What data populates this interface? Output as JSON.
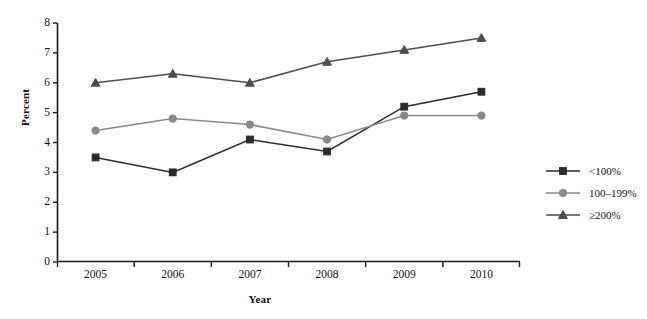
{
  "chart_data": {
    "type": "line",
    "title": "",
    "xlabel": "Year",
    "ylabel": "Percent",
    "categories": [
      "2005",
      "2006",
      "2007",
      "2008",
      "2009",
      "2010"
    ],
    "x": [
      2005,
      2006,
      2007,
      2008,
      2009,
      2010
    ],
    "ylim": [
      0,
      8
    ],
    "yticks": [
      0,
      1,
      2,
      3,
      4,
      5,
      6,
      7,
      8
    ],
    "ytick_labels": [
      "0",
      "1",
      "2",
      "3",
      "4",
      "5",
      "6",
      "7",
      "8"
    ],
    "grid": false,
    "legend_position": "right",
    "series": [
      {
        "name": "<100%",
        "values": [
          3.5,
          3.0,
          4.1,
          3.7,
          5.2,
          5.7
        ],
        "color": "#2b2b2b",
        "marker": "square"
      },
      {
        "name": "100–199%",
        "values": [
          4.4,
          4.8,
          4.6,
          4.1,
          4.9,
          4.9
        ],
        "color": "#8a8a8a",
        "marker": "circle"
      },
      {
        "name": "≥200%",
        "values": [
          6.0,
          6.3,
          6.0,
          6.7,
          7.1,
          7.5
        ],
        "color": "#4d4d4d",
        "marker": "triangle"
      }
    ]
  },
  "axes": {
    "y_title": "Percent",
    "x_title": "Year",
    "axis_color": "#1a1a1a"
  },
  "legend": {
    "entries": [
      {
        "label": "<100%",
        "color": "#2b2b2b",
        "marker": "square"
      },
      {
        "label": "100–199%",
        "color": "#8a8a8a",
        "marker": "circle"
      },
      {
        "label": "≥200%",
        "color": "#4d4d4d",
        "marker": "triangle"
      }
    ]
  }
}
